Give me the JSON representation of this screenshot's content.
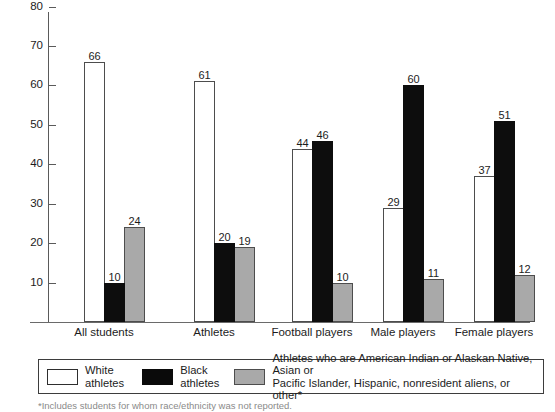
{
  "chart_data": {
    "type": "bar",
    "title": "",
    "subtitle": "",
    "xlabel": "",
    "ylabel": "",
    "ylim": [
      0,
      88
    ],
    "grid": false,
    "legend_position": "bottom",
    "y_ticks": [
      10,
      20,
      30,
      40,
      50,
      60,
      70,
      80
    ],
    "categories": [
      "All students",
      "Athletes",
      "Football players",
      "Male players",
      "Female players"
    ],
    "series": [
      {
        "name": "White athletes",
        "color": "#ffffff",
        "values": [
          66,
          61,
          44,
          29,
          37
        ]
      },
      {
        "name": "Black athletes",
        "color": "#0d0d0d",
        "values": [
          10,
          20,
          46,
          60,
          51
        ]
      },
      {
        "name": "Athletes who are American Indian or Alaskan Native, Asian or Pacific Islander, Hispanic, nonresident aliens, or other*",
        "color": "#a9a9a9",
        "values": [
          24,
          19,
          10,
          11,
          12
        ]
      }
    ]
  },
  "axis": {
    "y_tick_labels": [
      "80",
      "70",
      "60",
      "50",
      "40",
      "30",
      "20",
      "10"
    ]
  },
  "legend": {
    "items": [
      {
        "label": "White\nathletes",
        "swatch": "white"
      },
      {
        "label": "Black\nathletes",
        "swatch": "black"
      },
      {
        "label": "Athletes who are American Indian or Alaskan Native, Asian or\nPacific Islander, Hispanic, nonresident aliens, or other*",
        "swatch": "gray"
      }
    ]
  },
  "footnote": {
    "text": "*Includes students for whom race/ethnicity was not reported."
  }
}
